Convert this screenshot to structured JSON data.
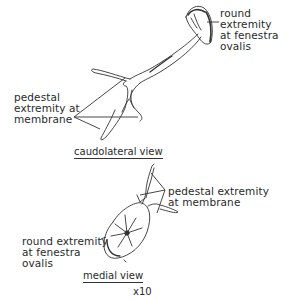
{
  "figure": {
    "top_view": {
      "caption": "caudolateral view",
      "labels": {
        "round_extremity": [
          "round",
          "extremity",
          "at fenestra",
          "ovalis"
        ],
        "pedestal_extremity": [
          "pedestal",
          "extremity at",
          "membrane"
        ]
      }
    },
    "bottom_view": {
      "caption": "medial view",
      "labels": {
        "pedestal_extremity": [
          "pedestal extremity",
          "at membrane"
        ],
        "round_extremity": [
          "round extremity",
          "at fenestra",
          "ovalis"
        ]
      }
    },
    "scale": "x10"
  }
}
